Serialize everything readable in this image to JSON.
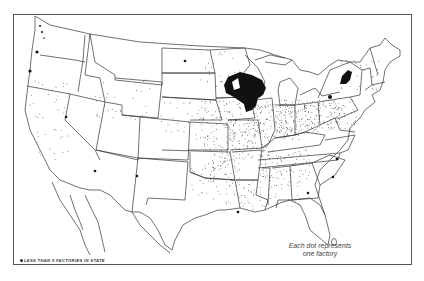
{
  "map": {
    "subject": "Factories in the United States (dot density)",
    "caption_line1": "Each dot represents",
    "caption_line2": "one factory",
    "legend_note": "LESS THAN 5 FACTORIES IN STATE",
    "colors": {
      "background": "#ffffff",
      "outline": "#333333",
      "dot": "#111111",
      "frame": "#555555"
    },
    "dense_regions": [
      "Wisconsin",
      "Northern Illinois",
      "Western New York",
      "Puget Sound, Washington",
      "Oregon coast"
    ],
    "low_count_states_marked": [
      "North Dakota",
      "Nevada",
      "Arizona",
      "New Mexico",
      "South Carolina",
      "Georgia",
      "Louisiana",
      "North Carolina"
    ]
  }
}
